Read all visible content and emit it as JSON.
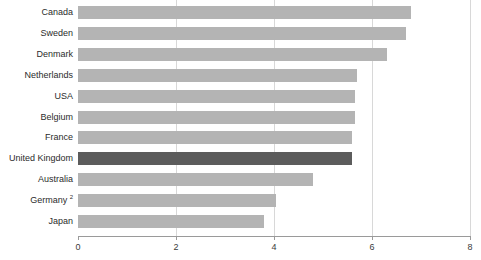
{
  "chart_data": {
    "type": "bar",
    "orientation": "horizontal",
    "title": "",
    "subtitle": "",
    "xlabel": "",
    "ylabel": "",
    "xlim": [
      0,
      8
    ],
    "ylim": null,
    "grid": true,
    "legend": null,
    "xticks": [
      0,
      2,
      4,
      6,
      8
    ],
    "xtick_labels": [
      "0",
      "2",
      "4",
      "6",
      "8"
    ],
    "categories": [
      "Canada",
      "Sweden",
      "Denmark",
      "Netherlands",
      "USA",
      "Belgium",
      "France",
      "United Kingdom",
      "Australia",
      "Germany",
      "Japan"
    ],
    "category_footnotes": [
      "",
      "",
      "",
      "",
      "",
      "",
      "",
      "",
      "",
      "2",
      ""
    ],
    "values": [
      6.8,
      6.7,
      6.3,
      5.7,
      5.65,
      5.65,
      5.6,
      5.6,
      4.8,
      4.05,
      3.8
    ],
    "highlight_category": "United Kingdom",
    "colors": {
      "bar": "#b4b4b4",
      "bar_highlight": "#5c5c5c",
      "gridline": "#d8d8d8",
      "axis": "#9a9a9a",
      "text": "#2b2b2b",
      "background": "#ffffff"
    }
  }
}
